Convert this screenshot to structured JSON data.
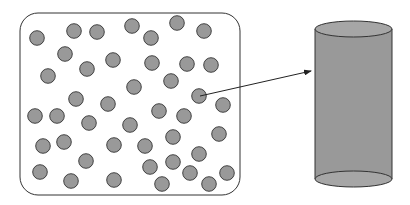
{
  "diagram": {
    "colors": {
      "background": "#ffffff",
      "stroke": "#333333",
      "particle_fill": "#999999",
      "cylinder_fill": "#999999",
      "cylinder_cap_fill": "#a6a6a6"
    },
    "container": {
      "x": 20,
      "y": 13,
      "width": 220,
      "height": 182,
      "corner_radius": 18
    },
    "particle_radius": 7.3,
    "particles": [
      [
        37,
        38
      ],
      [
        74,
        31
      ],
      [
        97,
        32
      ],
      [
        132,
        26
      ],
      [
        151,
        38
      ],
      [
        177,
        23
      ],
      [
        204,
        31
      ],
      [
        65,
        54
      ],
      [
        113,
        60
      ],
      [
        87,
        69
      ],
      [
        152,
        63
      ],
      [
        187,
        64
      ],
      [
        211,
        65
      ],
      [
        48,
        76
      ],
      [
        134,
        87
      ],
      [
        171,
        81
      ],
      [
        76,
        99
      ],
      [
        108,
        104
      ],
      [
        199,
        96
      ],
      [
        223,
        105
      ],
      [
        35,
        116
      ],
      [
        57,
        116
      ],
      [
        89,
        123
      ],
      [
        159,
        111
      ],
      [
        184,
        116
      ],
      [
        130,
        125
      ],
      [
        43,
        146
      ],
      [
        64,
        142
      ],
      [
        114,
        145
      ],
      [
        145,
        146
      ],
      [
        173,
        137
      ],
      [
        219,
        134
      ],
      [
        86,
        161
      ],
      [
        199,
        154
      ],
      [
        40,
        172
      ],
      [
        71,
        181
      ],
      [
        114,
        180
      ],
      [
        150,
        167
      ],
      [
        173,
        162
      ],
      [
        190,
        173
      ],
      [
        227,
        173
      ],
      [
        162,
        184
      ],
      [
        209,
        184
      ]
    ],
    "highlighted_particle_index": 18,
    "arrow": {
      "from": [
        200,
        96
      ],
      "to": [
        311,
        71
      ]
    },
    "cylinder": {
      "left": 315,
      "right": 392,
      "top_cy": 29,
      "bottom_cy": 179,
      "ry": 8
    }
  }
}
